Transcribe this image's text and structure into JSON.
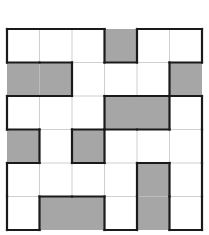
{
  "puzzle": {
    "rows": 6,
    "cols": 6,
    "legend": {
      "0": "white",
      "1": "shaded"
    },
    "colors": {
      "shaded": "#a6a6a6",
      "white": "#ffffff",
      "grid_line": "#cfcfcf",
      "outline": "#1a1a1a"
    },
    "grid": [
      [
        0,
        0,
        0,
        1,
        0,
        0
      ],
      [
        1,
        1,
        0,
        0,
        0,
        1
      ],
      [
        0,
        0,
        0,
        1,
        1,
        0
      ],
      [
        1,
        0,
        1,
        0,
        0,
        0
      ],
      [
        0,
        0,
        0,
        0,
        1,
        0
      ],
      [
        0,
        1,
        1,
        0,
        1,
        0
      ]
    ],
    "geometry": {
      "x0": 7,
      "y0": 29,
      "cell_w": 32.5,
      "cell_h": 33.5
    }
  }
}
